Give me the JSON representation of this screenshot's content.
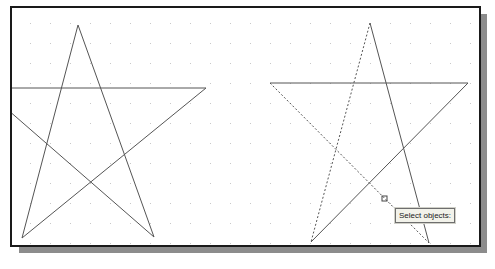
{
  "viewport": {
    "background": "#ffffff",
    "border_color": "#1a1a1a",
    "shadow_color": "#8c8c8c",
    "grid": {
      "spacing": 20,
      "dot_color": "#c8c8c8"
    }
  },
  "drawing": {
    "left_star": {
      "state": "unselected",
      "line_color": "#555555"
    },
    "right_star": {
      "state": "partially-selected",
      "line_color": "#555555"
    }
  },
  "cursor": {
    "type": "pickbox-icon"
  },
  "tooltip": {
    "text": "Select objects:"
  }
}
